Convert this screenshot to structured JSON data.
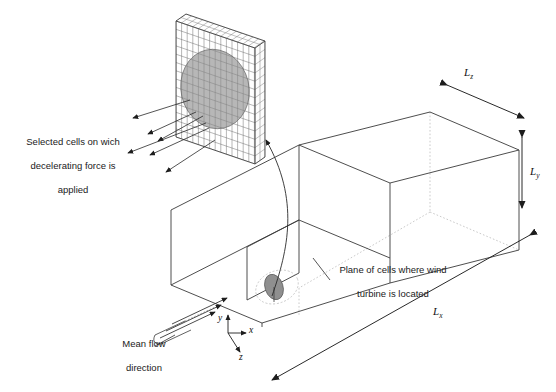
{
  "figure": {
    "type": "technical-diagram",
    "background": "#ffffff",
    "line_color": "#3a3a3a",
    "hidden_line_color": "#b9b9b9",
    "disk_fill": "#8f8f8f",
    "mesh_line_color": "#6e6e6e",
    "text_color": "#1a1a1a"
  },
  "annotations": {
    "selected_cells": {
      "text": "Selected cells on wich\ndecelerating force is\napplied",
      "line1": "Selected cells on wich",
      "line2": "decelerating force is",
      "line3": "applied",
      "arrow_count": 6
    },
    "turbine_plane": {
      "text": "Plane of cells where wind\nturbine is located",
      "line1": "Plane of cells where wind",
      "line2": "turbine is located"
    },
    "mean_flow": {
      "text": "Mean flow\ndirection",
      "line1": "Mean flow",
      "line2": "direction",
      "arrow_count": 3
    }
  },
  "dimensions": [
    {
      "name": "Lz",
      "symbol": "L",
      "subscript": "z",
      "placement": "top-right-diagonal"
    },
    {
      "name": "Ly",
      "symbol": "L",
      "subscript": "y",
      "placement": "right-vertical"
    },
    {
      "name": "Lx",
      "symbol": "L",
      "subscript": "x",
      "placement": "bottom-diagonal"
    }
  ],
  "axes": {
    "label_y": "y",
    "label_x": "x",
    "label_z": "z"
  },
  "mesh": {
    "columns": 14,
    "rows": 14,
    "disk_overlay": "ellipse"
  }
}
